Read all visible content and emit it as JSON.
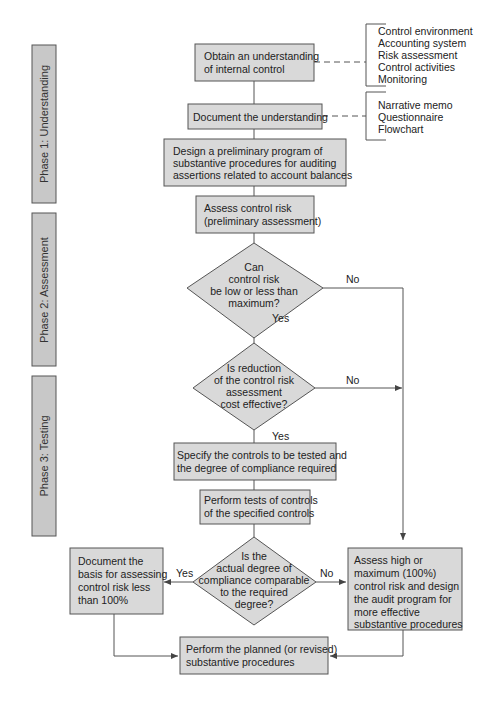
{
  "phases": [
    {
      "label": "Phase 1: Understanding"
    },
    {
      "label": "Phase 2: Assessment"
    },
    {
      "label": "Phase 3: Testing"
    }
  ],
  "nodes": {
    "obtain": {
      "lines": [
        "Obtain an understanding",
        "of internal control"
      ]
    },
    "document": {
      "lines": [
        "Document the understanding"
      ]
    },
    "design": {
      "lines": [
        "Design a preliminary program of",
        "substantive procedures for auditing",
        "assertions related to account balances"
      ]
    },
    "assess": {
      "lines": [
        "Assess control risk",
        "(preliminary assessment)"
      ]
    },
    "decision1": {
      "lines": [
        "Can",
        "control risk",
        "be low or less than",
        "maximum?"
      ]
    },
    "decision2": {
      "lines": [
        "Is reduction",
        "of the control risk",
        "assessment",
        "cost effective?"
      ]
    },
    "specify": {
      "lines": [
        "Specify the controls to be tested and",
        "the degree of compliance required"
      ]
    },
    "perform_tests": {
      "lines": [
        "Perform tests of controls",
        "of the specified controls"
      ]
    },
    "decision3": {
      "lines": [
        "Is the",
        "actual degree of",
        "compliance comparable",
        "to the required",
        "degree?"
      ]
    },
    "doc_basis": {
      "lines": [
        "Document the",
        "basis for assessing",
        "control risk less",
        "than 100%"
      ]
    },
    "assess_high": {
      "lines": [
        "Assess high or",
        "maximum (100%)",
        "control risk and design",
        "the audit program for",
        "more effective",
        "substantive procedures"
      ]
    },
    "perform_planned": {
      "lines": [
        "Perform the planned (or revised)",
        "substantive procedures"
      ]
    }
  },
  "annotations": {
    "components": [
      "Control environment",
      "Accounting system",
      "Risk assessment",
      "Control activities",
      "Monitoring"
    ],
    "documentation": [
      "Narrative memo",
      "Questionnaire",
      "Flowchart"
    ]
  },
  "edge_labels": {
    "d1_no": "No",
    "d1_yes": "Yes",
    "d2_no": "No",
    "d2_yes": "Yes",
    "d3_yes": "Yes",
    "d3_no": "No"
  }
}
